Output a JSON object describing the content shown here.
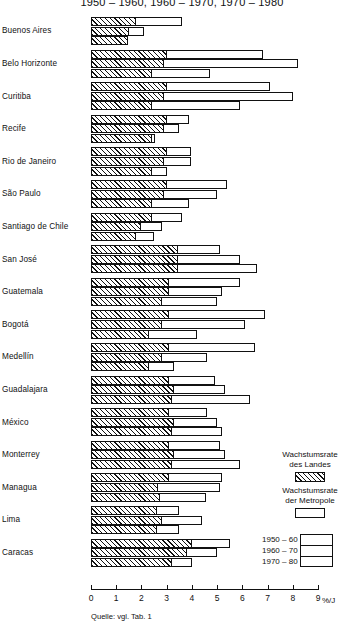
{
  "title": "1950 – 1960, 1960 – 1970, 1970 – 1980",
  "axis": {
    "unit_label": "%/J",
    "ticks": [
      "0",
      "1",
      "2",
      "3",
      "4",
      "5",
      "6",
      "7",
      "8",
      "9"
    ]
  },
  "source_note": "Quelle: vgl. Tab. 1",
  "legend": {
    "country_label_line1": "Wachstumsrate",
    "country_label_line2": "des Landes",
    "metro_label_line1": "Wachstumsrate",
    "metro_label_line2": "der Metropole",
    "periods": [
      "1950 – 60",
      "1960 – 70",
      "1970 – 80"
    ]
  },
  "chart_data": {
    "type": "bar",
    "orientation": "horizontal",
    "title": "1950 – 1960, 1960 – 1970, 1970 – 1980",
    "xlabel": "%/J",
    "ylabel": "",
    "xlim": [
      0,
      9
    ],
    "grid": false,
    "legend_position": "right",
    "series": [
      {
        "name": "Wachstumsrate des Landes",
        "style": "hatched"
      },
      {
        "name": "Wachstumsrate der Metropole",
        "style": "white"
      }
    ],
    "periods": [
      "1950 – 60",
      "1960 – 70",
      "1970 – 80"
    ],
    "categories": [
      "Buenos Aires",
      "Belo Horizonte",
      "Curitiba",
      "Recife",
      "Rio de Janeiro",
      "São Paulo",
      "Santiago de Chile",
      "San José",
      "Guatemala",
      "Bogotá",
      "Medellín",
      "Guadalajara",
      "México",
      "Monterrey",
      "Managua",
      "Lima",
      "Caracas"
    ],
    "rows": [
      {
        "city": "Buenos Aires",
        "bars": [
          {
            "period": "1950 – 60",
            "country": 1.8,
            "metro": 3.6
          },
          {
            "period": "1960 – 70",
            "country": 1.5,
            "metro": 2.1
          },
          {
            "period": "1970 – 80",
            "country": 1.45,
            "metro": 1.45
          }
        ]
      },
      {
        "city": "Belo Horizonte",
        "bars": [
          {
            "period": "1950 – 60",
            "country": 3.0,
            "metro": 6.8
          },
          {
            "period": "1960 – 70",
            "country": 2.9,
            "metro": 8.2
          },
          {
            "period": "1970 – 80",
            "country": 2.4,
            "metro": 4.7
          }
        ]
      },
      {
        "city": "Curitiba",
        "bars": [
          {
            "period": "1950 – 60",
            "country": 3.0,
            "metro": 7.1
          },
          {
            "period": "1960 – 70",
            "country": 2.9,
            "metro": 8.0
          },
          {
            "period": "1970 – 80",
            "country": 2.4,
            "metro": 5.9
          }
        ]
      },
      {
        "city": "Recife",
        "bars": [
          {
            "period": "1950 – 60",
            "country": 3.0,
            "metro": 3.9
          },
          {
            "period": "1960 – 70",
            "country": 2.9,
            "metro": 3.5
          },
          {
            "period": "1970 – 80",
            "country": 2.4,
            "metro": 2.55
          }
        ]
      },
      {
        "city": "Rio de Janeiro",
        "bars": [
          {
            "period": "1950 – 60",
            "country": 3.0,
            "metro": 3.95
          },
          {
            "period": "1960 – 70",
            "country": 2.9,
            "metro": 3.95
          },
          {
            "period": "1970 – 80",
            "country": 2.4,
            "metro": 3.0
          }
        ]
      },
      {
        "city": "São Paulo",
        "bars": [
          {
            "period": "1950 – 60",
            "country": 3.0,
            "metro": 5.4
          },
          {
            "period": "1960 – 70",
            "country": 2.9,
            "metro": 5.0
          },
          {
            "period": "1970 – 80",
            "country": 2.4,
            "metro": 3.9
          }
        ]
      },
      {
        "city": "Santiago de Chile",
        "bars": [
          {
            "period": "1950 – 60",
            "country": 2.4,
            "metro": 3.6
          },
          {
            "period": "1960 – 70",
            "country": 2.0,
            "metro": 2.8
          },
          {
            "period": "1970 – 80",
            "country": 1.8,
            "metro": 2.5
          }
        ]
      },
      {
        "city": "San José",
        "bars": [
          {
            "period": "1950 – 60",
            "country": 3.45,
            "metro": 5.1
          },
          {
            "period": "1960 – 70",
            "country": 3.45,
            "metro": 5.9
          },
          {
            "period": "1970 – 80",
            "country": 3.45,
            "metro": 6.6
          }
        ]
      },
      {
        "city": "Guatemala",
        "bars": [
          {
            "period": "1950 – 60",
            "country": 3.1,
            "metro": 5.9
          },
          {
            "period": "1960 – 70",
            "country": 3.1,
            "metro": 5.2
          },
          {
            "period": "1970 – 80",
            "country": 2.8,
            "metro": 5.0
          }
        ]
      },
      {
        "city": "Bogotá",
        "bars": [
          {
            "period": "1950 – 60",
            "country": 3.1,
            "metro": 6.9
          },
          {
            "period": "1960 – 70",
            "country": 2.8,
            "metro": 6.1
          },
          {
            "period": "1970 – 80",
            "country": 2.3,
            "metro": 4.2
          }
        ]
      },
      {
        "city": "Medellín",
        "bars": [
          {
            "period": "1950 – 60",
            "country": 3.1,
            "metro": 6.5
          },
          {
            "period": "1960 – 70",
            "country": 2.8,
            "metro": 4.6
          },
          {
            "period": "1970 – 80",
            "country": 2.3,
            "metro": 3.3
          }
        ]
      },
      {
        "city": "Guadalajara",
        "bars": [
          {
            "period": "1950 – 60",
            "country": 3.1,
            "metro": 4.9
          },
          {
            "period": "1960 – 70",
            "country": 3.3,
            "metro": 5.3
          },
          {
            "period": "1970 – 80",
            "country": 3.2,
            "metro": 6.3
          }
        ]
      },
      {
        "city": "México",
        "bars": [
          {
            "period": "1950 – 60",
            "country": 3.1,
            "metro": 4.6
          },
          {
            "period": "1960 – 70",
            "country": 3.3,
            "metro": 5.0
          },
          {
            "period": "1970 – 80",
            "country": 3.2,
            "metro": 5.2
          }
        ]
      },
      {
        "city": "Monterrey",
        "bars": [
          {
            "period": "1950 – 60",
            "country": 3.1,
            "metro": 5.1
          },
          {
            "period": "1960 – 70",
            "country": 3.3,
            "metro": 5.3
          },
          {
            "period": "1970 – 80",
            "country": 3.2,
            "metro": 5.9
          }
        ]
      },
      {
        "city": "Managua",
        "bars": [
          {
            "period": "1950 – 60",
            "country": 3.1,
            "metro": 5.2
          },
          {
            "period": "1960 – 70",
            "country": 2.65,
            "metro": 5.1
          },
          {
            "period": "1970 – 80",
            "country": 2.75,
            "metro": 4.55
          }
        ]
      },
      {
        "city": "Lima",
        "bars": [
          {
            "period": "1950 – 60",
            "country": 2.6,
            "metro": 3.5
          },
          {
            "period": "1960 – 70",
            "country": 2.8,
            "metro": 4.4
          },
          {
            "period": "1970 – 80",
            "country": 2.6,
            "metro": 3.5
          }
        ]
      },
      {
        "city": "Caracas",
        "bars": [
          {
            "period": "1950 – 60",
            "country": 4.0,
            "metro": 5.5
          },
          {
            "period": "1960 – 70",
            "country": 3.8,
            "metro": 5.0
          },
          {
            "period": "1970 – 80",
            "country": 3.2,
            "metro": 4.0
          }
        ]
      }
    ]
  }
}
